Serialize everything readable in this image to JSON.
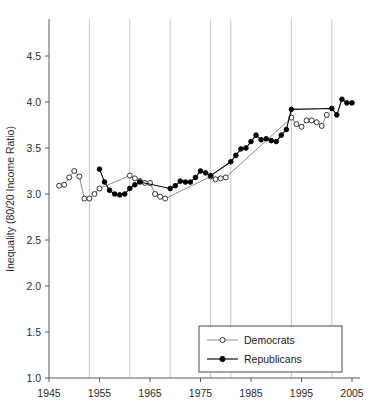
{
  "chart_data": {
    "type": "line",
    "title": "",
    "xlabel": "",
    "ylabel": "Inequality (80/20 Income Ratio)",
    "xlim": [
      1945,
      2005
    ],
    "ylim": [
      1.0,
      4.5
    ],
    "ytick_labels": [
      "1.0",
      "1.5",
      "2.0",
      "2.5",
      "3.0",
      "3.5",
      "4.0",
      "4.5"
    ],
    "ytick_values": [
      1.0,
      1.5,
      2.0,
      2.5,
      3.0,
      3.5,
      4.0,
      4.5
    ],
    "xtick_labels": [
      "1945",
      "1955",
      "1965",
      "1975",
      "1985",
      "1995",
      "2005"
    ],
    "xtick_values": [
      1945,
      1955,
      1965,
      1975,
      1985,
      1995,
      2005
    ],
    "grid": "vertical gridlines at presidential party transitions",
    "gridline_values": [
      1953,
      1961,
      1969,
      1977,
      1981,
      1993,
      2001
    ],
    "legend_position": "bottom-right",
    "series": [
      {
        "name": "Democrats",
        "marker": "open-circle",
        "color": "#000000",
        "points": [
          [
            1947,
            3.09
          ],
          [
            1948,
            3.1
          ],
          [
            1949,
            3.18
          ],
          [
            1950,
            3.25
          ],
          [
            1951,
            3.19
          ],
          [
            1952,
            2.95
          ],
          [
            1953,
            2.95
          ],
          [
            1954,
            3.0
          ],
          [
            1955,
            3.06
          ],
          [
            1961,
            3.2
          ],
          [
            1962,
            3.17
          ],
          [
            1963,
            3.14
          ],
          [
            1964,
            3.12
          ],
          [
            1965,
            3.12
          ],
          [
            1966,
            3.0
          ],
          [
            1967,
            2.97
          ],
          [
            1968,
            2.95
          ],
          [
            1977,
            3.19
          ],
          [
            1978,
            3.16
          ],
          [
            1979,
            3.17
          ],
          [
            1980,
            3.18
          ],
          [
            1993,
            3.83
          ],
          [
            1994,
            3.76
          ],
          [
            1995,
            3.73
          ],
          [
            1996,
            3.8
          ],
          [
            1997,
            3.8
          ],
          [
            1998,
            3.78
          ],
          [
            1999,
            3.74
          ],
          [
            2000,
            3.86
          ]
        ]
      },
      {
        "name": "Republicans",
        "marker": "filled-circle",
        "color": "#000000",
        "points": [
          [
            1955,
            3.27
          ],
          [
            1956,
            3.13
          ],
          [
            1957,
            3.04
          ],
          [
            1958,
            3.0
          ],
          [
            1959,
            2.99
          ],
          [
            1960,
            3.0
          ],
          [
            1961,
            3.06
          ],
          [
            1962,
            3.1
          ],
          [
            1963,
            3.13
          ],
          [
            1969,
            3.06
          ],
          [
            1970,
            3.09
          ],
          [
            1971,
            3.14
          ],
          [
            1972,
            3.13
          ],
          [
            1973,
            3.13
          ],
          [
            1974,
            3.18
          ],
          [
            1975,
            3.25
          ],
          [
            1976,
            3.23
          ],
          [
            1977,
            3.2
          ],
          [
            1981,
            3.35
          ],
          [
            1982,
            3.42
          ],
          [
            1983,
            3.49
          ],
          [
            1984,
            3.5
          ],
          [
            1985,
            3.57
          ],
          [
            1986,
            3.64
          ],
          [
            1987,
            3.59
          ],
          [
            1988,
            3.6
          ],
          [
            1989,
            3.58
          ],
          [
            1990,
            3.57
          ],
          [
            1991,
            3.64
          ],
          [
            1992,
            3.7
          ],
          [
            1993,
            3.92
          ],
          [
            2001,
            3.93
          ],
          [
            2002,
            3.86
          ],
          [
            2003,
            4.03
          ],
          [
            2004,
            3.99
          ],
          [
            2005,
            3.99
          ]
        ]
      }
    ]
  },
  "legend": {
    "items": [
      {
        "label": "Democrats",
        "marker": "open-circle"
      },
      {
        "label": "Republicans",
        "marker": "filled-circle"
      }
    ]
  }
}
